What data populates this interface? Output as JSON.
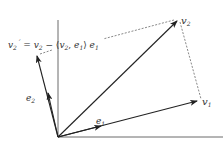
{
  "diagram": {
    "colors": {
      "stroke": "#222222",
      "dashed": "#555555",
      "text": "#333333",
      "axis": "#444444"
    },
    "labels": {
      "v1": {
        "base": "v",
        "sub": "1"
      },
      "v2": {
        "base": "v",
        "sub": "2"
      },
      "e1": {
        "base": "e",
        "sub": "1"
      },
      "e2": {
        "base": "e",
        "sub": "2"
      },
      "formula": {
        "lhs_base": "v",
        "lhs_sub": "2",
        "lhs_prime": "´",
        "eq": " = ",
        "t1_base": "v",
        "t1_sub": "2",
        "minus": " − ⟨",
        "t2_base": "v",
        "t2_sub": "2",
        "comma": ", ",
        "t3_base": "e",
        "t3_sub": "1",
        "close": "⟩ ",
        "t4_base": "e",
        "t4_sub": "1"
      }
    }
  }
}
